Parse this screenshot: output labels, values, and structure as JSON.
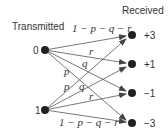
{
  "title_left": "Transmitted",
  "title_right": "Received",
  "sources": [
    {
      "label": "0",
      "x": 45,
      "y": 50
    },
    {
      "label": "1",
      "x": 45,
      "y": 110
    }
  ],
  "targets": [
    {
      "label": "+3",
      "x": 132,
      "y": 35
    },
    {
      "label": "+1",
      "x": 132,
      "y": 64
    },
    {
      "label": "−1",
      "x": 132,
      "y": 93
    },
    {
      "label": "−3",
      "x": 132,
      "y": 123
    }
  ],
  "edges": [
    {
      "from": 0,
      "to": 0,
      "label": "1 − p − q − r"
    },
    {
      "from": 0,
      "to": 1,
      "label": "r"
    },
    {
      "from": 0,
      "to": 2,
      "label": "q"
    },
    {
      "from": 0,
      "to": 3,
      "label": "p"
    },
    {
      "from": 1,
      "to": 0,
      "label": "p"
    },
    {
      "from": 1,
      "to": 1,
      "label": "q"
    },
    {
      "from": 1,
      "to": 2,
      "label": "r"
    },
    {
      "from": 1,
      "to": 3,
      "label": "1 − p − q − r"
    }
  ],
  "edge_labels": {
    "top": "1 − p − q − r",
    "bottom": "1 − p − q − r",
    "r_top": "r",
    "q_top": "q",
    "p_upper": "p",
    "p_lower": "p",
    "q_lower": "q",
    "r_bottom": "r"
  }
}
